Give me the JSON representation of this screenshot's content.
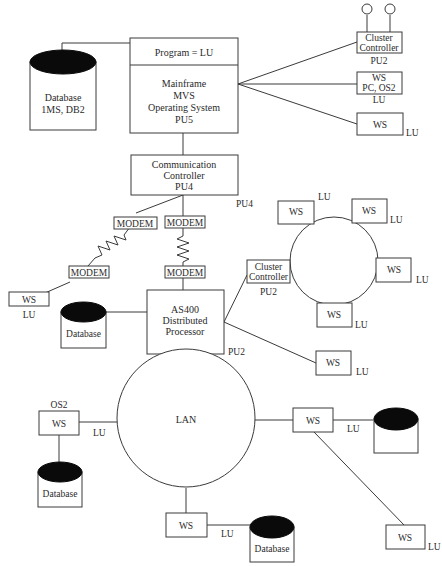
{
  "mainframe": {
    "program_label": "Program = LU",
    "lines": [
      "Mainframe",
      "MVS",
      "Operating System",
      "PU5"
    ]
  },
  "database_top": {
    "lines": [
      "Database",
      "1MS, DB2"
    ]
  },
  "cluster_controller_top": {
    "lines": [
      "Cluster",
      "Controller"
    ],
    "pu": "PU2"
  },
  "ws_pc": {
    "lines": [
      "WS",
      "PC, OS2"
    ],
    "lu": "LU"
  },
  "ws_top": {
    "label": "WS",
    "lu": "LU"
  },
  "comm_controller": {
    "lines": [
      "Communication",
      "Controller",
      "PU4"
    ],
    "pu": "PU4"
  },
  "modems": {
    "label": "MODEM"
  },
  "ws_left": {
    "label": "WS",
    "lu": "LU"
  },
  "database_as400": {
    "label": "Database"
  },
  "as400": {
    "lines": [
      "AS400",
      "Distributed",
      "Processor"
    ],
    "pu": "PU2"
  },
  "ring": {
    "cluster": {
      "lines": [
        "Cluster",
        "Controller"
      ],
      "pu": "PU2"
    },
    "ws_label": "WS",
    "lu": "LU"
  },
  "ws_as400_right": {
    "label": "WS",
    "lu": "LU"
  },
  "lan": {
    "label": "LAN"
  },
  "ws_os2": {
    "os": "OS2",
    "label": "WS",
    "lu": "LU"
  },
  "database_os2": {
    "label": "Database"
  },
  "ws_lan_right": {
    "label": "WS",
    "lu": "LU"
  },
  "ws_lan_bottom": {
    "label": "WS",
    "lu": "LU"
  },
  "database_bottom": {
    "label": "Database"
  },
  "ws_far_right": {
    "label": "WS",
    "lu": "LU"
  }
}
